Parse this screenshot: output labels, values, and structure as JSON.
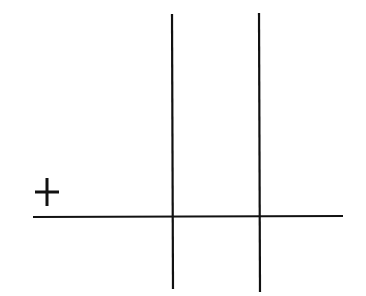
{
  "diagram": {
    "stroke_color": "#111111",
    "background": "#ffffff",
    "plus_sign": {
      "cx": 47,
      "cy": 192,
      "half": 12
    },
    "horizontal_line": {
      "x1": 33,
      "y1": 217,
      "x2": 343,
      "y2": 216
    },
    "vertical_lines": [
      {
        "x1": 172,
        "y1": 14,
        "x2": 173,
        "y2": 289
      },
      {
        "x1": 259,
        "y1": 13,
        "x2": 260,
        "y2": 292
      }
    ]
  }
}
